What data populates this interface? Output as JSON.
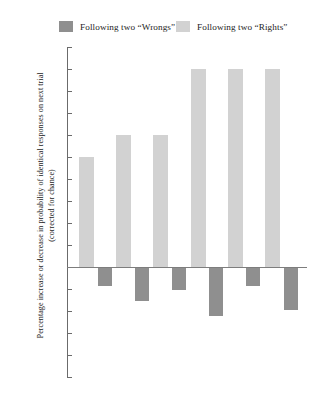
{
  "legend": {
    "items": [
      {
        "label": "Following two “Wrongs”",
        "color": "#8f8f8f",
        "key": "wrongs"
      },
      {
        "label": "Following two “Rights”",
        "color": "#d2d2d2",
        "key": "rights"
      }
    ]
  },
  "axis": {
    "y_title": "Percentage increase or decrease in probability of identical responses on next trial (corrected for chance)",
    "ticks": [
      "100",
      "90",
      "80",
      "70",
      "60",
      "50",
      "40",
      "30",
      "20",
      "10",
      "0",
      "–10",
      "–20",
      "–30",
      "–40",
      "–50"
    ]
  },
  "chart_data": {
    "type": "bar",
    "title": "",
    "xlabel": "",
    "ylabel": "Percentage increase or decrease in probability of identical responses on next trial (corrected for chance)",
    "ylim": [
      -50,
      100
    ],
    "ytick_step": 10,
    "grid": false,
    "legend_position": "top",
    "categories": [
      "1",
      "2",
      "3",
      "4",
      "5",
      "6"
    ],
    "series": [
      {
        "name": "Following two “Rights”",
        "color": "#d2d2d2",
        "values": [
          50,
          60,
          60,
          90,
          90,
          90
        ]
      },
      {
        "name": "Following two “Wrongs”",
        "color": "#8f8f8f",
        "values": [
          -8,
          -15,
          -10,
          -22,
          -8,
          -19
        ]
      }
    ]
  }
}
